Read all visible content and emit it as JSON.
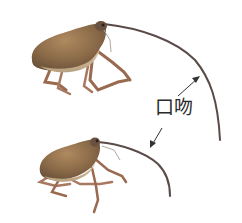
{
  "figure": {
    "label": "口吻",
    "subjects": [
      {
        "name": "weevil-upper",
        "description": "weevil with long curved rostrum (larger)"
      },
      {
        "name": "weevil-lower",
        "description": "weevil with shorter curved rostrum"
      }
    ],
    "colors": {
      "background": "#ffffff",
      "body": "#8a6a48",
      "body_light": "#c8b08a",
      "legs": "#9a6a50",
      "rostrum": "#5a4a48",
      "arrow": "#333333"
    }
  }
}
